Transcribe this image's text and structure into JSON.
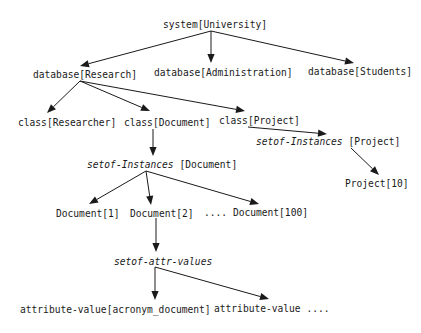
{
  "diagram": {
    "type": "hierarchy-tree",
    "nodes": [
      {
        "id": "university",
        "label": "system[University]",
        "x": 163,
        "y": 19
      },
      {
        "id": "research",
        "label": "database[Research]",
        "x": 33,
        "y": 69
      },
      {
        "id": "administration",
        "label": "database[Administration]",
        "x": 154,
        "y": 67
      },
      {
        "id": "students",
        "label": "database[Students]",
        "x": 308,
        "y": 66
      },
      {
        "id": "researcher",
        "label": "class[Researcher]",
        "x": 18,
        "y": 117
      },
      {
        "id": "document-class",
        "label": "class[Document]",
        "x": 124,
        "y": 117
      },
      {
        "id": "project-class",
        "label": "class[Project]",
        "x": 219,
        "y": 115
      },
      {
        "id": "setof-project",
        "label_italic": "setof-Instances",
        "label_rest": " [Project]",
        "x": 256,
        "y": 136
      },
      {
        "id": "project10",
        "label": "Project[10]",
        "x": 345,
        "y": 178
      },
      {
        "id": "setof-document",
        "label_italic": "setof-Instances",
        "label_rest": " [Document]",
        "x": 87,
        "y": 159
      },
      {
        "id": "document1",
        "label": "Document[1]",
        "x": 56,
        "y": 208
      },
      {
        "id": "document2",
        "label": "Document[2]",
        "x": 130,
        "y": 208
      },
      {
        "id": "document100",
        "label": ".... Document[100]",
        "x": 204,
        "y": 207
      },
      {
        "id": "setof-attr",
        "label_italic": "setof-attr-values",
        "label_rest": "",
        "x": 114,
        "y": 256
      },
      {
        "id": "attr-acronym",
        "label": "attribute-value[acronym_document]",
        "x": 20,
        "y": 304
      },
      {
        "id": "attr-more",
        "label": "attribute-value ....",
        "x": 214,
        "y": 303
      }
    ],
    "edges": [
      {
        "from": "university",
        "to": "research",
        "x1": 211,
        "y1": 31,
        "x2": 80,
        "y2": 66
      },
      {
        "from": "university",
        "to": "administration",
        "x1": 211,
        "y1": 31,
        "x2": 211,
        "y2": 63
      },
      {
        "from": "university",
        "to": "students",
        "x1": 211,
        "y1": 31,
        "x2": 354,
        "y2": 63
      },
      {
        "from": "research",
        "to": "researcher",
        "x1": 80,
        "y1": 81,
        "x2": 47,
        "y2": 113
      },
      {
        "from": "research",
        "to": "document-class",
        "x1": 80,
        "y1": 81,
        "x2": 150,
        "y2": 111
      },
      {
        "from": "research",
        "to": "project-class",
        "x1": 80,
        "y1": 81,
        "x2": 245,
        "y2": 111
      },
      {
        "from": "project-class",
        "to": "setof-project",
        "x1": 248,
        "y1": 127,
        "x2": 327,
        "y2": 134
      },
      {
        "from": "setof-project",
        "to": "project10",
        "x1": 351,
        "y1": 148,
        "x2": 379,
        "y2": 175
      },
      {
        "from": "document-class",
        "to": "setof-document",
        "x1": 153,
        "y1": 129,
        "x2": 153,
        "y2": 156
      },
      {
        "from": "setof-document",
        "to": "document1",
        "x1": 146,
        "y1": 171,
        "x2": 89,
        "y2": 204
      },
      {
        "from": "setof-document",
        "to": "document2",
        "x1": 146,
        "y1": 171,
        "x2": 151,
        "y2": 205
      },
      {
        "from": "setof-document",
        "to": "document100",
        "x1": 146,
        "y1": 171,
        "x2": 259,
        "y2": 204
      },
      {
        "from": "document2",
        "to": "setof-attr",
        "x1": 156,
        "y1": 218,
        "x2": 156,
        "y2": 252
      },
      {
        "from": "setof-attr",
        "to": "attr-acronym",
        "x1": 155,
        "y1": 267,
        "x2": 155,
        "y2": 300
      },
      {
        "from": "setof-attr",
        "to": "attr-more",
        "x1": 155,
        "y1": 267,
        "x2": 269,
        "y2": 299
      }
    ],
    "colors": {
      "line": "#1a1a1a",
      "text": "#1a1a1a",
      "background": "#ffffff"
    }
  }
}
